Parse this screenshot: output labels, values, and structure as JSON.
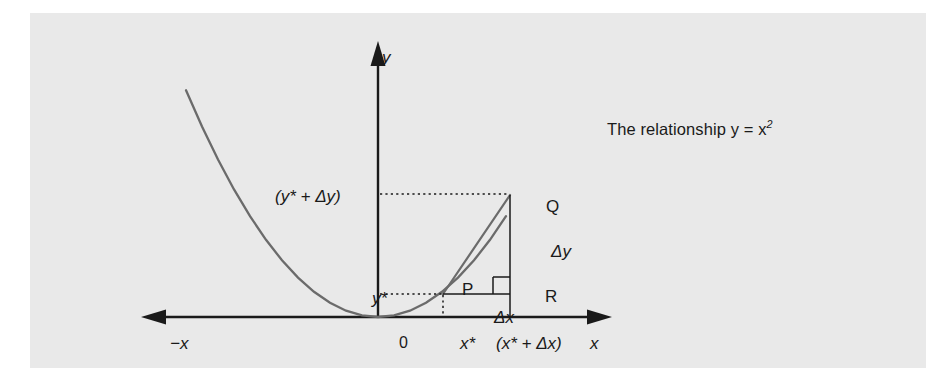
{
  "figure": {
    "background_color": "#e9e9e9",
    "page_color": "#ffffff",
    "ink_color": "#1a1a1a",
    "curve_color": "#6b6b6b",
    "caption": "The relationship y = x",
    "caption_exponent": "2"
  },
  "axes": {
    "y_label": "y",
    "x_label": "x",
    "negative_x_label": "−x",
    "origin_label": "0"
  },
  "annotations": {
    "x_star": "x*",
    "x_star_plus_dx": "(x* + Δx)",
    "y_star": "y*",
    "y_star_plus_dy": "(y* + Δy)",
    "point_p": "P",
    "point_q": "Q",
    "point_r": "R",
    "delta_y": "Δy",
    "delta_x": "Δx"
  },
  "chart_data": {
    "type": "line",
    "function": "y = x^2",
    "xlabel": "x",
    "ylabel": "y",
    "grid": false,
    "legend": null,
    "xlim": [
      -3.05,
      2.05
    ],
    "ylim": [
      0,
      9
    ],
    "series": [
      {
        "name": "y = x^2",
        "comment": "parabola through vertex at origin",
        "x": [
          -3.0,
          -2.75,
          -2.5,
          -2.25,
          -2.0,
          -1.75,
          -1.5,
          -1.25,
          -1.0,
          -0.75,
          -0.5,
          -0.25,
          0.0,
          0.25,
          0.5,
          0.75,
          1.0,
          1.25,
          1.5,
          1.75,
          2.0
        ],
        "y": [
          9.0,
          7.5625,
          6.25,
          5.0625,
          4.0,
          3.0625,
          2.25,
          1.5625,
          1.0,
          0.5625,
          0.25,
          0.0625,
          0.0,
          0.0625,
          0.25,
          0.5625,
          1.0,
          1.5625,
          2.25,
          3.0625,
          4.0
        ]
      },
      {
        "name": "secant chord PQ",
        "x": [
          0.85,
          1.72
        ],
        "y": [
          0.7225,
          2.9584
        ]
      }
    ],
    "points": [
      {
        "label": "P",
        "x": 0.85,
        "y": 0.7225
      },
      {
        "label": "Q",
        "x": 1.72,
        "y": 2.9584
      },
      {
        "label": "R",
        "x": 1.72,
        "y": 0.7225
      }
    ],
    "annotations": [
      {
        "text": "Δx",
        "meaning": "horizontal run from P to R"
      },
      {
        "text": "Δy",
        "meaning": "vertical rise from R to Q"
      },
      {
        "text": "x*",
        "meaning": "x-coordinate of P"
      },
      {
        "text": "(x* + Δx)",
        "meaning": "x-coordinate of Q and R"
      },
      {
        "text": "y*",
        "meaning": "y-coordinate of P"
      },
      {
        "text": "(y* + Δy)",
        "meaning": "y-coordinate of Q"
      },
      {
        "text": "right-angle mark at R",
        "meaning": "PR perpendicular to QR"
      }
    ]
  }
}
